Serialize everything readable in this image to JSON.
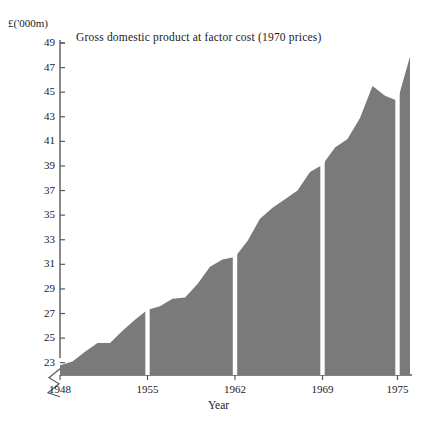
{
  "chart_data": {
    "type": "area",
    "title": "Gross domestic product at factor cost (1970 prices)",
    "xlabel": "Year",
    "ylabel": "",
    "yunit": "£('000m)",
    "xlim": [
      1948,
      1976
    ],
    "ylim": [
      22,
      49
    ],
    "ytick_labels": [
      "49",
      "47",
      "45",
      "43",
      "41",
      "39",
      "37",
      "35",
      "33",
      "31",
      "29",
      "27",
      "25",
      "23"
    ],
    "ytick_values": [
      49,
      47,
      45,
      43,
      41,
      39,
      37,
      35,
      33,
      31,
      29,
      27,
      25,
      23
    ],
    "xtick_labels": [
      "1948",
      "1955",
      "1962",
      "1969",
      "1975"
    ],
    "xtick_values": [
      1948,
      1955,
      1962,
      1969,
      1975
    ],
    "axis_break": true,
    "grid": false,
    "legend": null,
    "fill_color": "#7a7a7a",
    "axis_color": "#5a5a5a",
    "separator_years": [
      1955,
      1962,
      1969,
      1975
    ],
    "x": [
      1948,
      1949,
      1950,
      1951,
      1952,
      1953,
      1954,
      1955,
      1956,
      1957,
      1958,
      1959,
      1960,
      1961,
      1962,
      1963,
      1964,
      1965,
      1966,
      1967,
      1968,
      1969,
      1970,
      1971,
      1972,
      1973,
      1974,
      1975,
      1976
    ],
    "values": [
      22.8,
      23.1,
      23.9,
      24.6,
      24.6,
      25.6,
      26.5,
      27.3,
      27.6,
      28.2,
      28.3,
      29.4,
      30.8,
      31.4,
      31.6,
      32.9,
      34.7,
      35.6,
      36.3,
      37.0,
      38.5,
      39.1,
      40.5,
      41.2,
      42.9,
      45.5,
      44.7,
      44.3,
      47.9
    ],
    "values_note": "GDP at factor cost, 1970 prices, £'000m"
  },
  "labels": {
    "unit": "£('000m)",
    "title": "Gross domestic product at factor cost (1970 prices)",
    "xaxis": "Year"
  }
}
